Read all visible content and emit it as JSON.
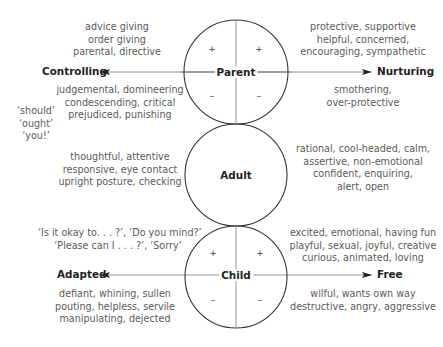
{
  "axes": {
    "parent_left": "Controlling",
    "parent_right": "Nurturing",
    "child_left": "Adapted",
    "child_right": "Free"
  },
  "ego_states": {
    "parent": "Parent",
    "adult": "Adult",
    "child": "Child"
  },
  "signs": {
    "plus": "+",
    "minus": "–"
  },
  "texts": {
    "controlling_positive": [
      "advice giving",
      "order giving",
      "parental, directive"
    ],
    "controlling_negative": [
      "judgemental, domineering",
      "condescending, critical",
      "prejudiced, punishing"
    ],
    "controlling_words": [
      "‘should’",
      "‘ought’",
      "‘you!’"
    ],
    "nurturing_positive": [
      "protective, supportive",
      "helpful, concerned,",
      "encouraging, sympathetic"
    ],
    "nurturing_negative": [
      "smothering,",
      "over-protective"
    ],
    "adult_left": [
      "thoughtful, attentive",
      "responsive, eye contact",
      "upright posture, checking"
    ],
    "adult_right": [
      "rational, cool-headed, calm,",
      "assertive, non-emotional",
      "confident, enquiring,",
      "alert, open"
    ],
    "adapted_positive": [
      "‘Is it okay to. . . ?’, ‘Do you mind?’",
      "‘Please can I . . . ?’, ‘Sorry’"
    ],
    "adapted_negative": [
      "defiant, whining, sullen",
      "pouting, helpless, servile",
      "manipulating, dejected"
    ],
    "free_positive": [
      "excited, emotional, having fun",
      "playful, sexual, joyful, creative",
      "curious, animated, loving"
    ],
    "free_negative": [
      "wilful, wants own way",
      "destructive, angry, aggressive"
    ]
  }
}
